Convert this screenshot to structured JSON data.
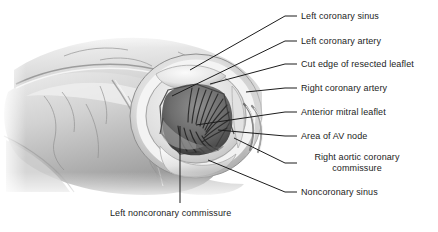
{
  "figure": {
    "style": "grayscale medical line-and-tone drawing",
    "colors": {
      "background": "#ffffff",
      "leader_line": "#1c1c1c",
      "label_text": "#1c1c1c",
      "tissue_light": "#e9e9e9",
      "tissue_mid": "#c2c2c2",
      "tissue_dark": "#8d8d8d",
      "tissue_shadow": "#5a5a5a",
      "orifice_dark": "#454545"
    }
  },
  "labels": [
    {
      "id": "left-coronary-sinus",
      "text": "Left coronary sinus",
      "line2": ""
    },
    {
      "id": "left-coronary-artery",
      "text": "Left coronary artery",
      "line2": ""
    },
    {
      "id": "cut-edge-resected-leaflet",
      "text": "Cut edge of resected leaflet",
      "line2": ""
    },
    {
      "id": "right-coronary-artery",
      "text": "Right coronary artery",
      "line2": ""
    },
    {
      "id": "anterior-mitral-leaflet",
      "text": "Anterior mitral leaflet",
      "line2": ""
    },
    {
      "id": "area-of-av-node",
      "text": "Area of AV node",
      "line2": ""
    },
    {
      "id": "right-aortic-coronary-commissure",
      "text": "Right aortic coronary",
      "line2": "commissure"
    },
    {
      "id": "noncoronary-sinus",
      "text": "Noncoronary sinus",
      "line2": ""
    },
    {
      "id": "left-noncoronary-commissure",
      "text": "Left noncoronary commissure",
      "line2": ""
    }
  ]
}
